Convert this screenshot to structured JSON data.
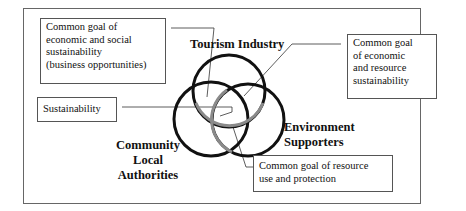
{
  "diagram": {
    "type": "venn",
    "sets": [
      {
        "name": "Tourism Industry"
      },
      {
        "name": "Environment Supporters",
        "lines": [
          "Environment",
          "Supporters"
        ]
      },
      {
        "name": "Community Local Authorities",
        "lines": [
          "Community",
          "Local",
          "Authorities"
        ]
      }
    ],
    "callouts": {
      "tourism_community": {
        "lines": [
          "Common goal of",
          "economic and social",
          "sustainability",
          "(business opportunities)"
        ]
      },
      "tourism_environment": {
        "lines": [
          "Common goal",
          "of economic",
          "and resource",
          "sustainability"
        ]
      },
      "center": {
        "lines": [
          "Sustainability"
        ]
      },
      "community_environment": {
        "lines": [
          "Common goal of resource",
          "use and protection"
        ]
      }
    },
    "colors": {
      "circle": "#111111",
      "overlap_arc": "#8a8a8a",
      "border": "#555555"
    }
  }
}
